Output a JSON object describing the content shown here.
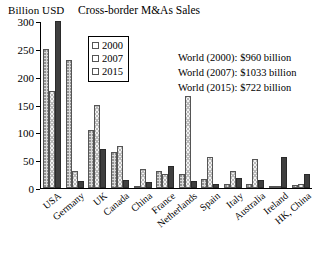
{
  "chart_data": {
    "type": "bar",
    "title": "Cross-border M&As Sales",
    "ylabel": "Billion USD",
    "xlabel": "",
    "ylim": [
      0,
      300
    ],
    "yticks": [
      0,
      50,
      100,
      150,
      200,
      250,
      300
    ],
    "grid": false,
    "legend_position": "upper-left-inside",
    "categories": [
      "USA",
      "Germany",
      "UK",
      "Canada",
      "China",
      "France",
      "Netherlands",
      "Spain",
      "Italy",
      "Australia",
      "Ireland",
      "HK, China"
    ],
    "series": [
      {
        "name": "2000",
        "color": "#d9d9d9",
        "values": [
          250,
          230,
          105,
          65,
          2,
          30,
          25,
          17,
          7,
          8,
          2,
          5
        ]
      },
      {
        "name": "2007",
        "color": "#f2f2f2",
        "values": [
          175,
          30,
          150,
          75,
          35,
          25,
          165,
          55,
          30,
          52,
          3,
          8
        ]
      },
      {
        "name": "2015",
        "color": "#3f3f3f",
        "values": [
          300,
          12,
          70,
          15,
          10,
          40,
          13,
          8,
          18,
          15,
          55,
          25
        ]
      }
    ],
    "annotations": [
      "World (2000): $960 billion",
      "World (2007): $1033 billion",
      "World (2015): $722 billion"
    ]
  }
}
